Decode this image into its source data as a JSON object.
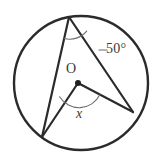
{
  "figure": {
    "name": "circle-inscribed-angle-diagram",
    "type": "geometry-diagram",
    "background_color": "#ffffff",
    "stroke_color": "#2b2b2b",
    "arc_color": "#6e6e6e",
    "labels": {
      "center": "O",
      "unknown_angle": "x",
      "known_angle": "50°"
    },
    "circle": {
      "center_x": 81,
      "center_y": 83,
      "radius": 67,
      "stroke_width": 2.4
    },
    "points": {
      "top": {
        "x": 69,
        "y": 17,
        "name": "top-vertex"
      },
      "bottom_left": {
        "x": 42,
        "y": 137,
        "name": "bottom-left-vertex"
      },
      "right": {
        "x": 133,
        "y": 112,
        "name": "right-vertex"
      },
      "center": {
        "x": 78,
        "y": 83,
        "name": "center-point"
      }
    },
    "segments": [
      {
        "name": "chord-top-to-bottom-left",
        "from": "top",
        "to": "bottom_left"
      },
      {
        "name": "chord-top-to-right",
        "from": "top",
        "to": "right"
      },
      {
        "name": "radius-center-to-bottom-left",
        "from": "center",
        "to": "bottom_left"
      },
      {
        "name": "radius-center-to-right",
        "from": "center",
        "to": "right"
      }
    ],
    "arcs": {
      "inscribed_angle_arc": {
        "name": "inscribed-angle-arc-at-top-vertex",
        "vertex": "top",
        "radius": 22
      },
      "central_angle_arc": {
        "name": "central-angle-arc-at-center",
        "vertex": "center",
        "radius": 23
      }
    },
    "leader_line": {
      "name": "leader-dash-to-50-degree-label",
      "x1": 99,
      "y1": 50,
      "x2": 106,
      "y2": 50
    }
  }
}
